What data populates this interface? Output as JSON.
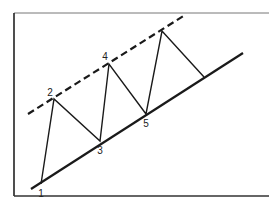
{
  "diagram": {
    "type": "ascending-channel",
    "labels": [
      {
        "text": "1",
        "x": 41,
        "y": 197
      },
      {
        "text": "2",
        "x": 50,
        "y": 96
      },
      {
        "text": "3",
        "x": 100,
        "y": 154
      },
      {
        "text": "4",
        "x": 105,
        "y": 60
      },
      {
        "text": "5",
        "x": 146,
        "y": 127
      }
    ],
    "frame": {
      "x1": 14,
      "y1": 13,
      "x2": 269,
      "y2": 196
    },
    "trendline_solid": {
      "x1": 31,
      "y1": 189,
      "x2": 243,
      "y2": 53
    },
    "channel_dashed": {
      "x1": 28,
      "y1": 114,
      "x2": 185,
      "y2": 15
    },
    "zigzag": [
      [
        41,
        184
      ],
      [
        54,
        99
      ],
      [
        100,
        141
      ],
      [
        109,
        64
      ],
      [
        146,
        114
      ],
      [
        162,
        31
      ],
      [
        204,
        77
      ]
    ],
    "colors": {
      "line": "#1a1a1a",
      "frame": "#333333",
      "background": "#ffffff"
    }
  }
}
